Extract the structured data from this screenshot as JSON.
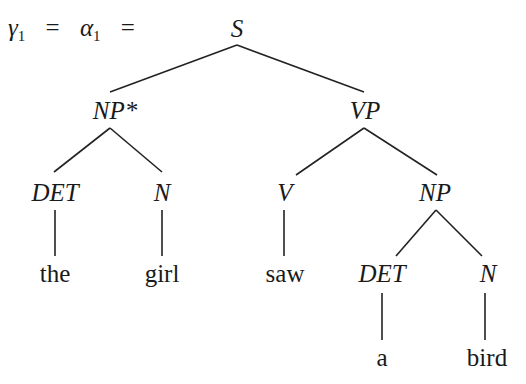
{
  "equation": {
    "gamma": "γ",
    "gamma_sub": "1",
    "eq1": "=",
    "alpha": "α",
    "alpha_sub": "1",
    "eq2": "="
  },
  "tree": {
    "root": {
      "label": "S",
      "x": 237,
      "y": 28
    },
    "nodes": [
      {
        "id": "np_star",
        "label": "NP*",
        "x": 115,
        "y": 110,
        "type": "category"
      },
      {
        "id": "vp",
        "label": "VP",
        "x": 365,
        "y": 110,
        "type": "category"
      },
      {
        "id": "det1",
        "label": "DET",
        "x": 55,
        "y": 192,
        "type": "category"
      },
      {
        "id": "n1",
        "label": "N",
        "x": 162,
        "y": 192,
        "type": "category"
      },
      {
        "id": "v",
        "label": "V",
        "x": 285,
        "y": 192,
        "type": "category"
      },
      {
        "id": "np2",
        "label": "NP",
        "x": 435,
        "y": 192,
        "type": "category"
      },
      {
        "id": "the",
        "label": "the",
        "x": 55,
        "y": 273,
        "type": "word"
      },
      {
        "id": "girl",
        "label": "girl",
        "x": 162,
        "y": 273,
        "type": "word"
      },
      {
        "id": "saw",
        "label": "saw",
        "x": 285,
        "y": 273,
        "type": "word"
      },
      {
        "id": "det2",
        "label": "DET",
        "x": 382,
        "y": 273,
        "type": "category"
      },
      {
        "id": "n2",
        "label": "N",
        "x": 488,
        "y": 273,
        "type": "category"
      },
      {
        "id": "a",
        "label": "a",
        "x": 382,
        "y": 357,
        "type": "word"
      },
      {
        "id": "bird",
        "label": "bird",
        "x": 487,
        "y": 357,
        "type": "word"
      }
    ],
    "edges": [
      [
        "S",
        "NP*"
      ],
      [
        "S",
        "VP"
      ],
      [
        "NP*",
        "DET"
      ],
      [
        "NP*",
        "N"
      ],
      [
        "VP",
        "V"
      ],
      [
        "VP",
        "NP"
      ],
      [
        "DET",
        "the"
      ],
      [
        "N",
        "girl"
      ],
      [
        "V",
        "saw"
      ],
      [
        "NP",
        "DET"
      ],
      [
        "NP",
        "N"
      ],
      [
        "DET",
        "a"
      ],
      [
        "N",
        "bird"
      ]
    ]
  }
}
